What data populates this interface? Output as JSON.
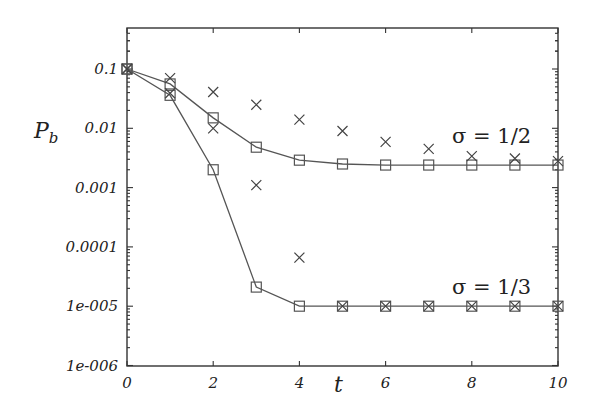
{
  "chart_data": {
    "type": "scatter",
    "title": "",
    "xlabel": "t",
    "ylabel": "P_b",
    "yscale": "log",
    "xlim": [
      0,
      10
    ],
    "ylim": [
      1e-06,
      0.4
    ],
    "grid": false,
    "legend": null,
    "x_ticks": [
      0,
      2,
      4,
      6,
      8,
      10
    ],
    "x_tick_labels": [
      "0",
      "2",
      "4",
      "6",
      "8",
      "10"
    ],
    "y_ticks": [
      0.1,
      0.01,
      0.001,
      0.0001,
      1e-05,
      1e-06
    ],
    "y_tick_labels": [
      "0.1",
      "0.01",
      "0.001",
      "0.0001",
      "1e-005",
      "1e-006"
    ],
    "x": [
      0,
      1,
      2,
      3,
      4,
      5,
      6,
      7,
      8,
      9,
      10
    ],
    "series": [
      {
        "name": "sigma = 1/2 (squares, line)",
        "marker": "square",
        "line": true,
        "values": [
          0.1,
          0.056,
          0.015,
          0.0048,
          0.0029,
          0.0025,
          0.0024,
          0.0024,
          0.0024,
          0.0024,
          0.0024
        ]
      },
      {
        "name": "sigma = 1/2 (crosses)",
        "marker": "x",
        "line": false,
        "values": [
          0.1,
          0.07,
          0.041,
          0.025,
          0.014,
          0.009,
          0.0059,
          0.0045,
          0.0034,
          0.0031,
          0.0028
        ]
      },
      {
        "name": "sigma = 1/3 (squares, line)",
        "marker": "square",
        "line": true,
        "values": [
          0.1,
          0.036,
          0.002,
          2.1e-05,
          1e-05,
          1e-05,
          1e-05,
          1e-05,
          1e-05,
          1e-05,
          1e-05
        ]
      },
      {
        "name": "sigma = 1/3 (crosses)",
        "marker": "x",
        "line": false,
        "values": [
          0.1,
          0.039,
          0.01,
          0.0011,
          6.6e-05,
          1e-05,
          1e-05,
          1e-05,
          1e-05,
          1e-05,
          1e-05
        ]
      }
    ],
    "annotations": [
      {
        "text": "σ = 1/2",
        "x": 8.4,
        "y": 0.0045
      },
      {
        "text": "σ = 1/3",
        "x": 8.4,
        "y": 2.2e-05
      }
    ]
  },
  "labels": {
    "ylabel_main": "P",
    "ylabel_sub": "b",
    "xlabel": "t",
    "annot_half": "σ = 1/2",
    "annot_third": "σ = 1/3"
  },
  "colors": {
    "frame": "#333333",
    "markers": "#555555",
    "text": "#222222"
  }
}
